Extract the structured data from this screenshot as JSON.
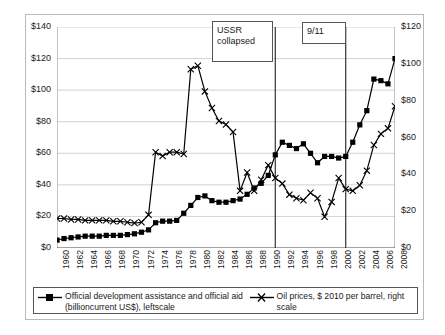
{
  "chart_data": {
    "type": "line",
    "title": "",
    "xlabel": "",
    "ylabel_left": "",
    "ylabel_right": "",
    "grid": true,
    "legend_position": "bottom",
    "x": [
      1960,
      1961,
      1962,
      1963,
      1964,
      1965,
      1966,
      1967,
      1968,
      1969,
      1970,
      1971,
      1972,
      1973,
      1974,
      1975,
      1976,
      1977,
      1978,
      1979,
      1980,
      1981,
      1982,
      1983,
      1984,
      1985,
      1986,
      1987,
      1988,
      1989,
      1990,
      1991,
      1992,
      1993,
      1994,
      1995,
      1996,
      1997,
      1998,
      1999,
      2000,
      2001,
      2002,
      2003,
      2004,
      2005,
      2006,
      2007,
      2008
    ],
    "xlim": [
      1960,
      2008
    ],
    "xticks": [
      1960,
      1962,
      1964,
      1966,
      1968,
      1970,
      1972,
      1974,
      1976,
      1978,
      1980,
      1982,
      1984,
      1986,
      1988,
      1990,
      1992,
      1994,
      1996,
      1998,
      2000,
      2002,
      2004,
      2006,
      2008
    ],
    "ylim_left": [
      0,
      140
    ],
    "yticks_left": [
      0,
      20,
      40,
      60,
      80,
      100,
      120,
      140
    ],
    "yticklabels_left": [
      "$0",
      "$20",
      "$40",
      "$60",
      "$80",
      "$100",
      "$120",
      "$140"
    ],
    "ylim_right": [
      0,
      120
    ],
    "yticks_right": [
      0,
      20,
      40,
      60,
      80,
      100,
      120
    ],
    "yticklabels_right": [
      "$0",
      "$20",
      "$40",
      "$60",
      "$80",
      "$100",
      "$120"
    ],
    "series": [
      {
        "name": "Official development assistance and official aid (billioncurrent US$), leftscale",
        "axis": "left",
        "marker": "square",
        "values": [
          5,
          6,
          6.5,
          7,
          7.5,
          7.5,
          7.5,
          8,
          8,
          8,
          8.5,
          9,
          10,
          11.5,
          16,
          17,
          17,
          17.5,
          22,
          27,
          32,
          33,
          30,
          29,
          29,
          30,
          31,
          34,
          38,
          41,
          46,
          59,
          67,
          65,
          63,
          66,
          60,
          54,
          58,
          58,
          57,
          58,
          67,
          78,
          87,
          107,
          106,
          104,
          120
        ]
      },
      {
        "name": "Oil prices, $ 2010 per barrel, right scale",
        "axis": "right",
        "marker": "x",
        "values": [
          16,
          16,
          15.5,
          15.5,
          15,
          15,
          15,
          15,
          14.5,
          14.5,
          14,
          13.5,
          14,
          18,
          52,
          50,
          52,
          52,
          51,
          97,
          99,
          85,
          76,
          69,
          67,
          63,
          31,
          41,
          31,
          37,
          45,
          38,
          35,
          29,
          27,
          26,
          30,
          27,
          17,
          25,
          38,
          32,
          31,
          34,
          42,
          56,
          62,
          65,
          77
        ]
      }
    ],
    "oil_values_left_equivalent": [
      18.7,
      18.7,
      18.1,
      18.1,
      17.5,
      17.5,
      17.5,
      17.5,
      16.9,
      16.9,
      16.3,
      15.8,
      16.3,
      21,
      60.7,
      58.3,
      60.7,
      60.7,
      59.5,
      113.2,
      115.5,
      99.2,
      88.7,
      80.5,
      78.2,
      73.5,
      36.2,
      47.8,
      36.2,
      43.2,
      52.5,
      44.3,
      40.8,
      33.8,
      31.5,
      30.3,
      35,
      31.5,
      19.8,
      29.2,
      44.3,
      37.3,
      36.2,
      39.7,
      49,
      65.3,
      72.3,
      75.8,
      89.8
    ]
  },
  "annotations": [
    {
      "id": "ussr",
      "text_line1": "USSR",
      "text_line2": "collapsed",
      "year": 1991
    },
    {
      "id": "nine-eleven",
      "text_line1": "9/11",
      "text_line2": "",
      "year": 2001
    }
  ],
  "legend": {
    "entries": [
      {
        "marker": "square-line",
        "label": "Official development assistance and official aid (billioncurrent US$), leftscale"
      },
      {
        "marker": "x-line",
        "label": "Oil prices, $ 2010 per barrel, right scale"
      }
    ]
  },
  "colors": {
    "series_line": "#000000",
    "grid": "#c7c7c7",
    "axis": "#8a8a8a",
    "frame": "#b9b9b9",
    "callout_border": "#555555",
    "background": "#ffffff"
  }
}
